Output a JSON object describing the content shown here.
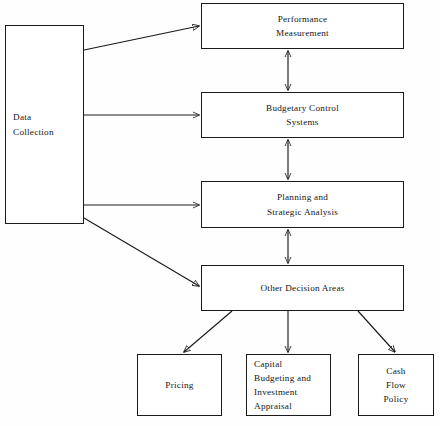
{
  "diagram": {
    "type": "flowchart",
    "background_color": "#fefefe",
    "line_color": "#1a1a1a",
    "text_color": "#151515",
    "nodes": [
      {
        "id": "data-collection",
        "label": "Data\nCollection",
        "x": 5,
        "y": 25,
        "w": 79,
        "h": 199
      },
      {
        "id": "performance-measurement",
        "label": "Performance\nMeasurement",
        "x": 201,
        "y": 3,
        "w": 203,
        "h": 46
      },
      {
        "id": "budgetary-control-systems",
        "label": "Budgetary Control\nSystems",
        "x": 201,
        "y": 92,
        "w": 203,
        "h": 46
      },
      {
        "id": "planning-and-strategic-analysis",
        "label": "Planning and\nStrategic Analysis",
        "x": 201,
        "y": 181,
        "w": 203,
        "h": 47
      },
      {
        "id": "other-decision-areas",
        "label": "Other Decision Areas",
        "x": 201,
        "y": 265,
        "w": 203,
        "h": 46
      },
      {
        "id": "pricing",
        "label": "Pricing",
        "x": 137,
        "y": 354,
        "w": 85,
        "h": 62
      },
      {
        "id": "capital-budgeting-and-investment-appraisal",
        "label": "Capital\nBudgeting and\nInvestment\nAppraisal",
        "x": 246,
        "y": 354,
        "w": 85,
        "h": 62
      },
      {
        "id": "cash-flow-policy",
        "label": "Cash\nFlow\nPolicy",
        "x": 358,
        "y": 354,
        "w": 76,
        "h": 62
      }
    ],
    "edges": [
      {
        "id": "data-collection-to-performance-measurement",
        "from": "data-collection",
        "to": "performance-measurement",
        "style": "single-arrow"
      },
      {
        "id": "data-collection-to-budgetary-control-systems",
        "from": "data-collection",
        "to": "budgetary-control-systems",
        "style": "single-arrow"
      },
      {
        "id": "data-collection-to-planning-and-strategic-analysis",
        "from": "data-collection",
        "to": "planning-and-strategic-analysis",
        "style": "single-arrow"
      },
      {
        "id": "data-collection-to-other-decision-areas",
        "from": "data-collection",
        "to": "other-decision-areas",
        "style": "single-arrow"
      },
      {
        "id": "performance-measurement-to-budgetary-control-systems",
        "from": "performance-measurement",
        "to": "budgetary-control-systems",
        "style": "double-arrow"
      },
      {
        "id": "budgetary-control-systems-to-planning-and-strategic-analysis",
        "from": "budgetary-control-systems",
        "to": "planning-and-strategic-analysis",
        "style": "double-arrow"
      },
      {
        "id": "planning-and-strategic-analysis-to-other-decision-areas",
        "from": "planning-and-strategic-analysis",
        "to": "other-decision-areas",
        "style": "double-arrow"
      },
      {
        "id": "other-decision-areas-to-pricing",
        "from": "other-decision-areas",
        "to": "pricing",
        "style": "single-arrow"
      },
      {
        "id": "other-decision-areas-to-capital-budgeting",
        "from": "other-decision-areas",
        "to": "capital-budgeting-and-investment-appraisal",
        "style": "single-arrow"
      },
      {
        "id": "other-decision-areas-to-cash-flow-policy",
        "from": "other-decision-areas",
        "to": "cash-flow-policy",
        "style": "single-arrow"
      }
    ]
  }
}
